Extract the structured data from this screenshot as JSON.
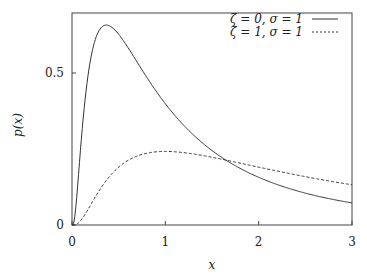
{
  "chart_data": {
    "type": "line",
    "title": "",
    "xlabel": "x",
    "ylabel": "p(x)",
    "xlim": [
      0,
      3
    ],
    "ylim": [
      0,
      0.7
    ],
    "xticks": [
      "0",
      "1",
      "2",
      "3"
    ],
    "yticks": [
      "0",
      "0.5"
    ],
    "grid": false,
    "legend_position": "top-right",
    "series": [
      {
        "name": "ζ = 0, σ = 1",
        "style": "solid",
        "zeta": 0,
        "sigma": 1,
        "x": [
          0.05,
          0.1,
          0.2,
          0.3,
          0.368,
          0.5,
          0.75,
          1.0,
          1.5,
          2.0,
          2.5,
          3.0
        ],
        "values": [
          0.0,
          0.283,
          0.546,
          0.644,
          0.657,
          0.627,
          0.504,
          0.399,
          0.245,
          0.157,
          0.104,
          0.073
        ]
      },
      {
        "name": "ζ = 1, σ = 1",
        "style": "dashed",
        "zeta": 1,
        "sigma": 1,
        "x": [
          0.05,
          0.1,
          0.2,
          0.3,
          0.5,
          0.75,
          1.0,
          1.5,
          2.0,
          2.5,
          3.0
        ],
        "values": [
          0.0,
          0.004,
          0.027,
          0.064,
          0.138,
          0.209,
          0.242,
          0.229,
          0.195,
          0.163,
          0.137
        ]
      }
    ]
  }
}
